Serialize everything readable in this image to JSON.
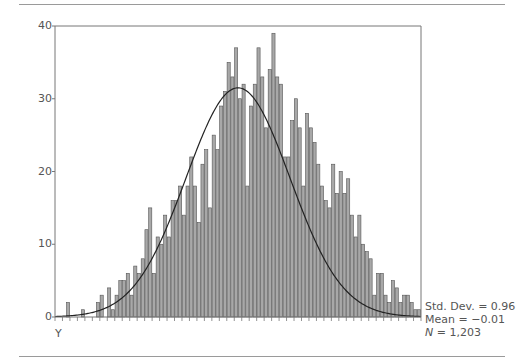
{
  "chart_data": {
    "type": "bar",
    "title": "",
    "xlabel": "Y",
    "ylabel": "",
    "ylim": [
      0,
      40
    ],
    "yticks": [
      0,
      10,
      20,
      30,
      40
    ],
    "grid": false,
    "bins": 98,
    "values": [
      0,
      0,
      0,
      2,
      0,
      0,
      0,
      1,
      0,
      0,
      0,
      2,
      3,
      0,
      4,
      1,
      3,
      5,
      5,
      6,
      3,
      7,
      6,
      8,
      12,
      15,
      6,
      11,
      10,
      14,
      11,
      16,
      16,
      18,
      14,
      18,
      22,
      18,
      13,
      21,
      23,
      15,
      25,
      23,
      29,
      31,
      35,
      33,
      37,
      30,
      32,
      18,
      29,
      32,
      37,
      33,
      26,
      34,
      39,
      33,
      32,
      22,
      22,
      27,
      30,
      26,
      18,
      28,
      26,
      24,
      21,
      18,
      16,
      15,
      21,
      17,
      20,
      17,
      19,
      14,
      11,
      14,
      10,
      9,
      8,
      3,
      6,
      6,
      3,
      2,
      5,
      4,
      2,
      3,
      3,
      2,
      1,
      1
    ],
    "normal_curve": {
      "mean": -0.01,
      "std_dev": 0.96,
      "peak": 31.5
    },
    "annotations": {
      "std_dev": "Std. Dev. = 0.96",
      "mean": "Mean = −0.01",
      "n_label": "N",
      "n_value": " = 1,203"
    }
  },
  "axis": {
    "y_labels": [
      "0",
      "10",
      "20",
      "30",
      "40"
    ],
    "x_label": "Y"
  },
  "colors": {
    "bar_fill": "#a8a8a8",
    "bar_stroke": "#555555",
    "curve": "#222222",
    "axis": "#777777"
  }
}
